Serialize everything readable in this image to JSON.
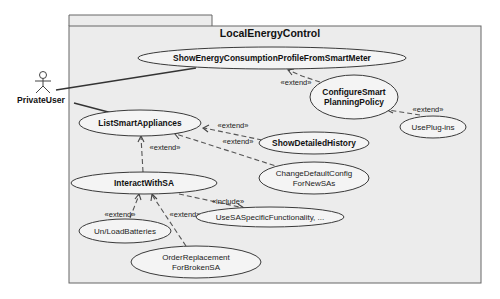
{
  "diagram": {
    "type": "UML use case diagram",
    "system": {
      "name": "LocalEnergyControl"
    },
    "actors": [
      {
        "id": "private_user",
        "label": "PrivateUser"
      }
    ],
    "use_cases": [
      {
        "id": "show_energy",
        "lines": [
          "ShowEnergyConsumptionProfileFromSmartMeter"
        ],
        "bold": true
      },
      {
        "id": "configure_smart",
        "lines": [
          "ConfigureSmart",
          "PlanningPolicy"
        ],
        "bold": true
      },
      {
        "id": "use_plugins",
        "lines": [
          "UsePlug-ins"
        ],
        "bold": false
      },
      {
        "id": "list_smart",
        "lines": [
          "ListSmartAppliances"
        ],
        "bold": true
      },
      {
        "id": "show_history",
        "lines": [
          "ShowDetailedHistory"
        ],
        "bold": true
      },
      {
        "id": "change_default",
        "lines": [
          "ChangeDefaultConfig",
          "ForNewSAs"
        ],
        "bold": false
      },
      {
        "id": "interact_sa",
        "lines": [
          "InteractWithSA"
        ],
        "bold": true
      },
      {
        "id": "use_sa_specific",
        "lines": [
          "UseSASpecificFunctionality, ..."
        ],
        "bold": false
      },
      {
        "id": "unload_batteries",
        "lines": [
          "Un/LoadBatteries"
        ],
        "bold": false
      },
      {
        "id": "order_replacement",
        "lines": [
          "OrderReplacement",
          "ForBrokenSA"
        ],
        "bold": false
      }
    ],
    "relationships": [
      {
        "type": "association",
        "from": "private_user",
        "to": "show_energy"
      },
      {
        "type": "association",
        "from": "private_user",
        "to": "list_smart"
      },
      {
        "type": "extend",
        "from": "configure_smart",
        "to": "show_energy",
        "label": "«extend»"
      },
      {
        "type": "extend",
        "from": "use_plugins",
        "to": "configure_smart",
        "label": "«extend»"
      },
      {
        "type": "extend",
        "from": "show_history",
        "to": "list_smart",
        "label": "«extend»"
      },
      {
        "type": "extend",
        "from": "change_default",
        "to": "list_smart",
        "label": "«extend»"
      },
      {
        "type": "extend",
        "from": "interact_sa",
        "to": "list_smart",
        "label": "«extend»"
      },
      {
        "type": "include",
        "from": "interact_sa",
        "to": "use_sa_specific",
        "label": "«include»"
      },
      {
        "type": "extend",
        "from": "unload_batteries",
        "to": "interact_sa",
        "label": "«extend»"
      },
      {
        "type": "extend",
        "from": "order_replacement",
        "to": "interact_sa",
        "label": "«extend»"
      }
    ]
  },
  "labels": {
    "system_name": "LocalEnergyControl",
    "actor": "PrivateUser",
    "uc_show_energy": "ShowEnergyConsumptionProfileFromSmartMeter",
    "uc_configure_1": "ConfigureSmart",
    "uc_configure_2": "PlanningPolicy",
    "uc_use_plugins": "UsePlug-ins",
    "uc_list_smart": "ListSmartAppliances",
    "uc_show_history": "ShowDetailedHistory",
    "uc_change_default_1": "ChangeDefaultConfig",
    "uc_change_default_2": "ForNewSAs",
    "uc_interact": "InteractWithSA",
    "uc_use_sa_specific": "UseSASpecificFunctionality, ...",
    "uc_unload": "Un/LoadBatteries",
    "uc_order_1": "OrderReplacement",
    "uc_order_2": "ForBrokenSA",
    "extend": "«extend»",
    "include": "«include»"
  },
  "colors": {
    "frame_fill": "#ededed",
    "frame_stroke": "#555555",
    "ellipse_fill": "#f4f4f4",
    "line": "#333333"
  }
}
